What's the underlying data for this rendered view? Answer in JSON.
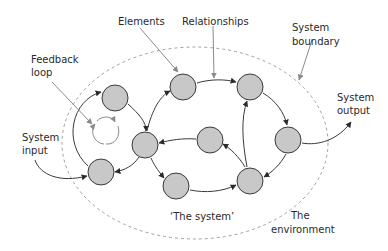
{
  "diagram": {
    "colors": {
      "node_fill": "#c8c8c8",
      "node_stroke": "#3a3a3a",
      "edge": "#3a3a3a",
      "pointer": "#8a8a8a",
      "boundary": "#9a9a9a"
    },
    "labels": {
      "elements": "Elements",
      "relationships": "Relationships",
      "feedback_line1": "Feedback",
      "feedback_line2": "loop",
      "boundary_line1": "System",
      "boundary_line2": "boundary",
      "output_line1": "System",
      "output_line2": "output",
      "input_line1": "System",
      "input_line2": "input",
      "the_system": "‘The system’",
      "environment_line1": "The",
      "environment_line2": "environment"
    },
    "nodes": [
      {
        "id": "A",
        "cx": 115,
        "cy": 98
      },
      {
        "id": "B",
        "cx": 101,
        "cy": 172
      },
      {
        "id": "C",
        "cx": 145,
        "cy": 145
      },
      {
        "id": "D",
        "cx": 183,
        "cy": 87
      },
      {
        "id": "E",
        "cx": 250,
        "cy": 87
      },
      {
        "id": "F",
        "cx": 210,
        "cy": 140
      },
      {
        "id": "G",
        "cx": 176,
        "cy": 186
      },
      {
        "id": "H",
        "cx": 288,
        "cy": 140
      },
      {
        "id": "I",
        "cx": 250,
        "cy": 181
      }
    ]
  }
}
